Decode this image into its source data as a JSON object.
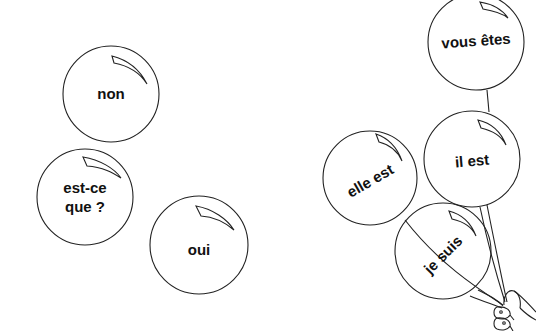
{
  "balloons": [
    {
      "id": "non",
      "text": "non",
      "cx": 111,
      "cy": 94,
      "r": 48,
      "rotate": 0
    },
    {
      "id": "est-ce-que",
      "line1": "est-ce",
      "line2": "que ?",
      "cx": 85,
      "cy": 197,
      "r": 48,
      "rotate": 0
    },
    {
      "id": "oui",
      "text": "oui",
      "cx": 199,
      "cy": 245,
      "r": 49,
      "rotate": 0
    },
    {
      "id": "vous-etes",
      "text": "vous êtes",
      "cx": 476,
      "cy": 42,
      "r": 48,
      "rotate": -4
    },
    {
      "id": "elle-est",
      "text": "elle est",
      "cx": 370,
      "cy": 178,
      "r": 47,
      "rotate": -30
    },
    {
      "id": "il-est",
      "text": "il est",
      "cx": 472,
      "cy": 159,
      "r": 48,
      "rotate": -5
    },
    {
      "id": "je-suis",
      "text": "je suis",
      "cx": 443,
      "cy": 251,
      "r": 48,
      "rotate": -45
    }
  ],
  "colors": {
    "stroke": "#222222",
    "text": "#111111",
    "background": "#ffffff"
  }
}
